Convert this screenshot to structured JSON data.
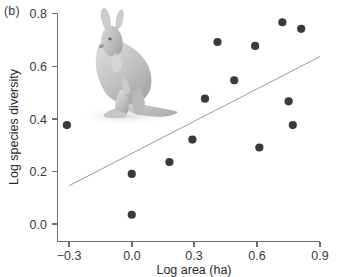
{
  "figure": {
    "panel_label": "(b)",
    "inset_image": "kangaroo-illustration"
  },
  "chart_data": {
    "type": "scatter",
    "title": "",
    "xlabel": "Log area (ha)",
    "ylabel": "Log species diversity",
    "xlim": [
      -0.3,
      0.9
    ],
    "ylim": [
      0.0,
      0.8
    ],
    "xticks": [
      -0.3,
      0.0,
      0.3,
      0.6,
      0.9
    ],
    "xtick_labels": [
      "−0.3",
      "0.0",
      "0.3",
      "0.6",
      "0.9"
    ],
    "yticks": [
      0.0,
      0.2,
      0.4,
      0.6,
      0.8
    ],
    "ytick_labels": [
      "0.0",
      "0.2",
      "0.4",
      "0.6",
      "0.8"
    ],
    "grid": false,
    "legend": false,
    "point_color": "#3a3a3a",
    "line_color": "#9a9a9a",
    "x": [
      -0.31,
      0.0,
      0.0,
      0.18,
      0.29,
      0.35,
      0.41,
      0.49,
      0.59,
      0.61,
      0.72,
      0.75,
      0.77,
      0.81
    ],
    "y": [
      0.375,
      0.19,
      0.035,
      0.235,
      0.32,
      0.475,
      0.69,
      0.545,
      0.675,
      0.29,
      0.765,
      0.465,
      0.375,
      0.74
    ],
    "trendline": {
      "x": [
        -0.3,
        0.9
      ],
      "y": [
        0.145,
        0.635
      ]
    }
  }
}
